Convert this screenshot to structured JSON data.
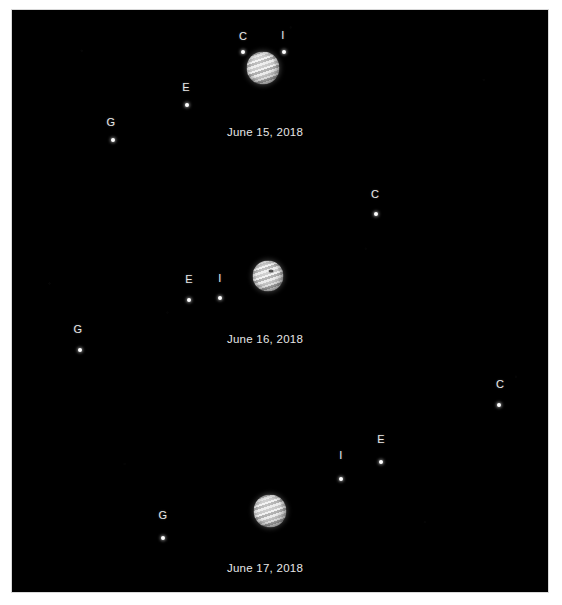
{
  "figure": {
    "background_color": "#ffffff",
    "sky_color": "#000000",
    "label_color": "#e9e9e9"
  },
  "moon_key": {
    "C": "Callisto",
    "E": "Europa",
    "G": "Ganymede",
    "I": "Io"
  },
  "panels": [
    {
      "id": "panel-june-15",
      "date": "June 15, 2018",
      "date_x": 265,
      "date_y": 133,
      "jupiter": {
        "x": 263,
        "y": 68,
        "size": 33,
        "spot_x": 0,
        "spot_y": 0,
        "show_spot": false
      },
      "moons": [
        {
          "name": "C",
          "label_x": 243,
          "label_y": 36,
          "dot_x": 243,
          "dot_y": 52
        },
        {
          "name": "I",
          "label_x": 283,
          "label_y": 35,
          "dot_x": 284,
          "dot_y": 52
        },
        {
          "name": "E",
          "label_x": 186,
          "label_y": 87,
          "dot_x": 187,
          "dot_y": 105
        },
        {
          "name": "G",
          "label_x": 111,
          "label_y": 122,
          "dot_x": 113,
          "dot_y": 140
        }
      ]
    },
    {
      "id": "panel-june-16",
      "date": "June 16, 2018",
      "date_x": 265,
      "date_y": 340,
      "jupiter": {
        "x": 268,
        "y": 276,
        "size": 31,
        "spot_x": 3,
        "spot_y": -5,
        "show_spot": true
      },
      "moons": [
        {
          "name": "C",
          "label_x": 375,
          "label_y": 194,
          "dot_x": 376,
          "dot_y": 214
        },
        {
          "name": "E",
          "label_x": 189,
          "label_y": 279,
          "dot_x": 189,
          "dot_y": 300
        },
        {
          "name": "I",
          "label_x": 220,
          "label_y": 278,
          "dot_x": 220,
          "dot_y": 298
        },
        {
          "name": "G",
          "label_x": 78,
          "label_y": 329,
          "dot_x": 80,
          "dot_y": 350
        }
      ]
    },
    {
      "id": "panel-june-17",
      "date": "June 17, 2018",
      "date_x": 265,
      "date_y": 569,
      "jupiter": {
        "x": 270,
        "y": 511,
        "size": 33,
        "spot_x": 0,
        "spot_y": 0,
        "show_spot": false
      },
      "moons": [
        {
          "name": "C",
          "label_x": 500,
          "label_y": 384,
          "dot_x": 499,
          "dot_y": 405
        },
        {
          "name": "E",
          "label_x": 381,
          "label_y": 439,
          "dot_x": 381,
          "dot_y": 462
        },
        {
          "name": "I",
          "label_x": 341,
          "label_y": 455,
          "dot_x": 341,
          "dot_y": 479
        },
        {
          "name": "G",
          "label_x": 163,
          "label_y": 515,
          "dot_x": 163,
          "dot_y": 538
        }
      ]
    }
  ]
}
